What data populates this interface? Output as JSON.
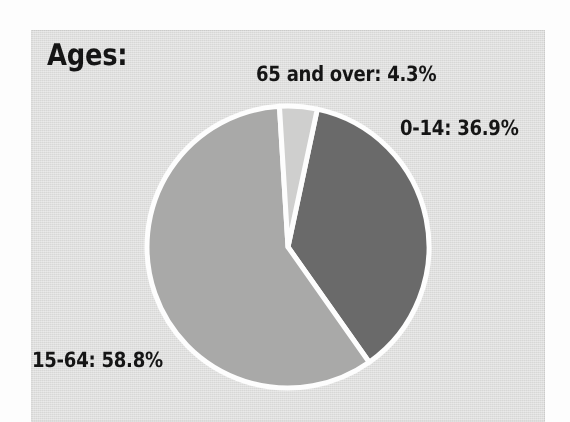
{
  "figure": {
    "title": "Ages:",
    "background_color": "#dededd",
    "outer_color": "#fdfdfd",
    "text_color": "#151515"
  },
  "chart_data": {
    "type": "pie",
    "title": "Ages:",
    "xlabel": "",
    "ylabel": "",
    "grid": false,
    "legend_position": "none",
    "label_style": "outside-annotations",
    "unit": "%",
    "total": 100.0,
    "start_angle_deg": 12,
    "direction": "clockwise",
    "categories": [
      "0-14",
      "15-64",
      "65 and over"
    ],
    "values": [
      36.9,
      58.8,
      4.3
    ],
    "labels": [
      "0-14: 36.9%",
      "15-64: 58.8%",
      "65 and over: 4.3%"
    ],
    "colors": [
      "#6b6b6b",
      "#a9a9a8",
      "#cfcfce"
    ],
    "slice_border_color": "#fdfdfd",
    "slice_border_width": 5,
    "slices": [
      {
        "name": "0-14",
        "label": "0-14: 36.9%",
        "value": 36.9,
        "color": "#6b6b6b",
        "start_angle_deg": 12.0,
        "sweep_angle_deg": 132.84
      },
      {
        "name": "15-64",
        "label": "15-64: 58.8%",
        "value": 58.8,
        "color": "#a9a9a8",
        "start_angle_deg": 144.84,
        "sweep_angle_deg": 211.68
      },
      {
        "name": "65 and over",
        "label": "65 and over: 4.3%",
        "value": 4.3,
        "color": "#cfcfce",
        "start_angle_deg": 356.52,
        "sweep_angle_deg": 15.48
      }
    ],
    "geometry": {
      "center_x": 288,
      "center_y": 247,
      "radius": 141
    }
  }
}
